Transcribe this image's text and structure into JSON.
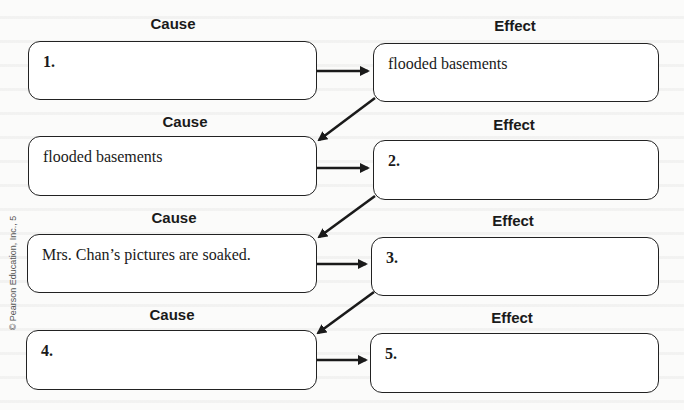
{
  "headers": {
    "cause": "Cause",
    "effect": "Effect"
  },
  "rows": [
    {
      "cause": {
        "text": "1.",
        "is_number": true
      },
      "effect": {
        "text": "flooded basements",
        "is_number": false
      }
    },
    {
      "cause": {
        "text": "flooded basements",
        "is_number": false
      },
      "effect": {
        "text": "2.",
        "is_number": true
      }
    },
    {
      "cause": {
        "text": "Mrs. Chan’s pictures are soaked.",
        "is_number": false
      },
      "effect": {
        "text": "3.",
        "is_number": true
      }
    },
    {
      "cause": {
        "text": "4.",
        "is_number": true
      },
      "effect": {
        "text": "5.",
        "is_number": true
      }
    }
  ],
  "copyright": "© Pearson Education, Inc., 5",
  "colors": {
    "stroke": "#222222",
    "background": "#fbfbfa",
    "box_fill": "#ffffff"
  },
  "icons": {
    "cause_to_effect": "right-arrow-icon",
    "effect_to_next_cause": "diagonal-down-left-arrow-icon"
  }
}
